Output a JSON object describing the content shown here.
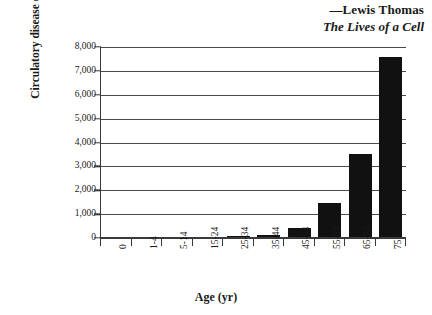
{
  "attribution": {
    "author": "—Lewis Thomas",
    "work": "The Lives of a Cell"
  },
  "chart_data": {
    "type": "bar",
    "title": "",
    "xlabel": "Age (yr)",
    "ylabel_line1": "Circulatory disease deaths",
    "ylabel_line2": "(annually/100,000)",
    "categories": [
      "0",
      "1-4",
      "5-14",
      "15-24",
      "25-34",
      "35-44",
      "45-54",
      "55-64",
      "65-74",
      "75+"
    ],
    "values": [
      20,
      10,
      10,
      40,
      70,
      130,
      400,
      1450,
      3500,
      7600
    ],
    "ylim": [
      0,
      8000
    ],
    "ytick_labels": [
      "0",
      "1,000",
      "2,000",
      "3,000",
      "4,000",
      "5,000",
      "6,000",
      "7,000",
      "8,000"
    ],
    "ytick_values": [
      0,
      1000,
      2000,
      3000,
      4000,
      5000,
      6000,
      7000,
      8000
    ],
    "grid": true,
    "legend": "none",
    "bar_color": "#111111",
    "axis_color": "#3a3a3a"
  }
}
